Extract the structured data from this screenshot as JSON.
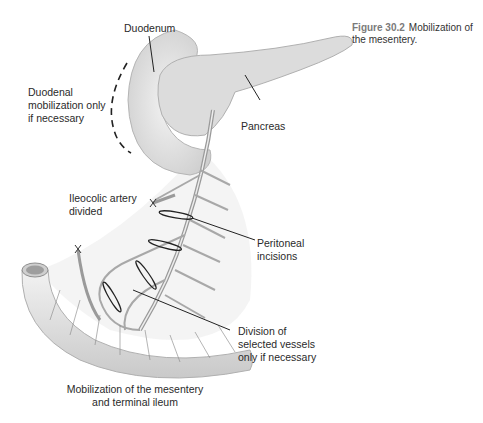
{
  "caption": {
    "figure_number": "Figure 30.2",
    "text": "Mobilization of the mesentery."
  },
  "labels": {
    "duodenum": "Duodenum",
    "duodenal_mobilization": [
      "Duodenal",
      "mobilization only",
      "if necessary"
    ],
    "pancreas": "Pancreas",
    "ileocolic": [
      "Ileocolic artery",
      "divided"
    ],
    "peritoneal": [
      "Peritoneal",
      "incisions"
    ],
    "division": [
      "Division of",
      "selected vessels",
      "only if necessary"
    ],
    "bottom_title": [
      "Mobilization of the mesentery",
      "and terminal ileum"
    ]
  },
  "colors": {
    "organ_fill": "#e6e6e6",
    "organ_shade": "#c8c8c8",
    "vessel": "#9a9a9a",
    "line": "#222222"
  }
}
